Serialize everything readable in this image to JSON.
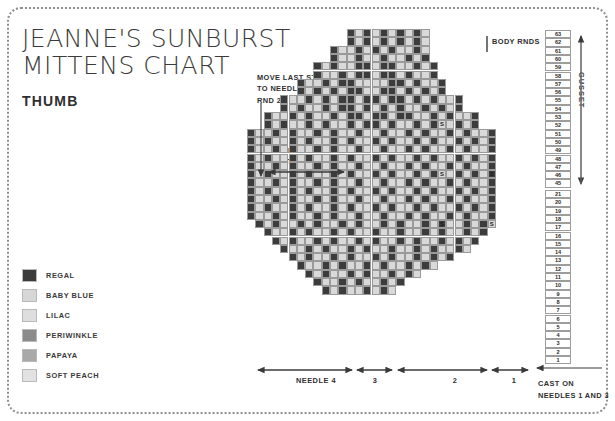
{
  "title": {
    "line1": "JEANNE'S SUNBURST",
    "line2": "MITTENS CHART",
    "subtitle": "THUMB"
  },
  "legend": {
    "items": [
      {
        "label": "REGAL",
        "color": "#3c3c3c"
      },
      {
        "label": "BABY BLUE",
        "color": "#d7d7d7"
      },
      {
        "label": "LILAC",
        "color": "#dedede"
      },
      {
        "label": "PERIWINKLE",
        "color": "#8b8b8b"
      },
      {
        "label": "PAPAYA",
        "color": "#a9a9a9"
      },
      {
        "label": "SOFT PEACH",
        "color": "#e2e2e2"
      }
    ]
  },
  "annotations": {
    "move_stitch": [
      "MOVE LAST STITCH",
      "TO NEEDLE 1 AFTER",
      "RND 24"
    ],
    "inside_thumb": [
      "INSIDE THUMB",
      "(7 STS)"
    ],
    "body_rnds": "BODY RNDS",
    "gusset": "GUSSET",
    "cast_on": [
      "CAST ON",
      "NEEDLES 1 AND 3"
    ]
  },
  "needle_labels": [
    {
      "text": "NEEDLE  4",
      "x": 266,
      "width": 100
    },
    {
      "text": "3",
      "x": 355,
      "width": 40
    },
    {
      "text": "2",
      "x": 400,
      "width": 110
    },
    {
      "text": "1",
      "x": 494,
      "width": 40
    }
  ],
  "row_numbers": {
    "gusset": [
      63,
      62,
      61,
      60,
      59,
      58,
      57,
      56,
      55,
      54,
      53,
      52,
      51,
      50,
      49,
      48,
      47,
      46,
      45
    ],
    "body": [
      21,
      20,
      19,
      18,
      17,
      16,
      15,
      14,
      13,
      12,
      11,
      10,
      9,
      8,
      7,
      6,
      5,
      4,
      3,
      2,
      1
    ]
  },
  "chart_data": {
    "type": "heatmap",
    "cell_size": 8.3,
    "palette": {
      "d": "#3c3c3c",
      "l": "#d9d9d9",
      "m": "#8b8b8b",
      "p": "#a9a9a9",
      "w": "#ffffff",
      "_": null
    },
    "legend_keys": {
      "d": "REGAL",
      "l": "BABY BLUE",
      "m": "PERIWINKLE",
      "p": "PAPAYA",
      "w": "SOFT PEACH"
    },
    "comment": "Rows are listed top (rnd 63) to bottom (rnd 1). '_' = empty/no stitch. 36 columns wide.",
    "rows": [
      "____________dldldldldl______________",
      "____________dldldldldl______________",
      "__________dlldldldlldl______________",
      "__________dlldlldlldld______________",
      "________dldllddlddlldld_____________",
      "________dlldlddlddldlld_____________",
      "______dlldlddllllddldlld____________",
      "______dldldlddllddldldld____________",
      "____dlldldlddlddlddldldlld__________",
      "____dldlldlddldldldlldldld__________",
      "__dlldldlldlddlddlddlldldlld________",
      "__dldlldldlldlddldlldldlldld________",
      "dlldldlldldlldlldlldldlldldlld______",
      "dldlldldlldldlldldlldldlldldld______",
      "dlldldlldldlldlldlldldlldldlld______",
      "dldlldldlldldlldldlldldlldldld______",
      "dlldldlldldlldlldlldldlldldlld______",
      "dldlldldlldldlldldlldldlldldld______",
      "dlldldlldldlldlldlldldlldldlld______",
      "dldlldldlldldlldldlldldlldldld______",
      "dlldldlldldlldlldlldldlldldlld______",
      "dldlldldlldldlldldlldldlldldld______",
      "dlldldlldldlldlldlldldlldldlld______",
      "_dldlldldlldldlldldlldldlldldl______",
      "__dlldldlldldlldlldlldldlldld_______",
      "___dldlldldlldldlldldlldldld________",
      "____dlldldlldldlldlldldlldl_________",
      "_____dldlldldlldldlldldld___________",
      "______dlldldlldldlldldl_____________",
      "_______dldlldldlldldl_______________",
      "________dlldldlldld_________________",
      "_________dldlldldl__________________"
    ],
    "markers": [
      {
        "row": 11,
        "col": 23,
        "label": "S"
      },
      {
        "row": 11,
        "col": 29,
        "label": "S"
      },
      {
        "row": 17,
        "col": 23,
        "label": "S"
      },
      {
        "row": 17,
        "col": 29,
        "label": "S"
      },
      {
        "row": 23,
        "col": 23,
        "label": "S"
      },
      {
        "row": 23,
        "col": 29,
        "label": "S"
      }
    ]
  }
}
